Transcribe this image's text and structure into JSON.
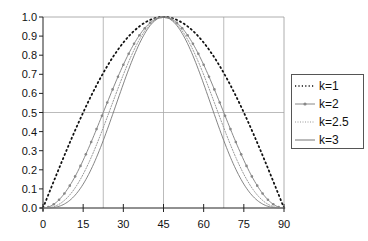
{
  "chart_data": {
    "type": "line",
    "title": "",
    "xlabel": "",
    "ylabel": "",
    "xlim": [
      0,
      90
    ],
    "ylim": [
      0,
      1.0
    ],
    "x_ticks": [
      "0",
      "15",
      "30",
      "45",
      "60",
      "75",
      "90"
    ],
    "y_ticks": [
      "0.0",
      "0.1",
      "0.2",
      "0.3",
      "0.4",
      "0.5",
      "0.6",
      "0.7",
      "0.8",
      "0.9",
      "1.0"
    ],
    "grid": {
      "vertical": [
        22.5,
        45,
        67.5
      ],
      "horizontal": [
        0.5
      ]
    },
    "legend_position": "right",
    "x": [
      0,
      7.5,
      15,
      22.5,
      30,
      37.5,
      45,
      52.5,
      60,
      67.5,
      75,
      82.5,
      90
    ],
    "series": [
      {
        "name": "k=1",
        "style": "dotted-black",
        "values": [
          0.0,
          0.259,
          0.5,
          0.707,
          0.866,
          0.966,
          1.0,
          0.966,
          0.866,
          0.707,
          0.5,
          0.259,
          0.0
        ]
      },
      {
        "name": "k=2",
        "style": "gray-with-markers",
        "values": [
          0.0,
          0.067,
          0.25,
          0.5,
          0.75,
          0.933,
          1.0,
          0.933,
          0.75,
          0.5,
          0.25,
          0.067,
          0.0
        ]
      },
      {
        "name": "k=2.5",
        "style": "dotted-gray",
        "values": [
          0.0,
          0.034,
          0.177,
          0.42,
          0.698,
          0.917,
          1.0,
          0.917,
          0.698,
          0.42,
          0.177,
          0.034,
          0.0
        ]
      },
      {
        "name": "k=3",
        "style": "thin-gray",
        "values": [
          0.0,
          0.017,
          0.125,
          0.354,
          0.65,
          0.901,
          1.0,
          0.901,
          0.65,
          0.354,
          0.125,
          0.017,
          0.0
        ]
      }
    ]
  },
  "legend": {
    "items": [
      {
        "label": "k=1"
      },
      {
        "label": "k=2"
      },
      {
        "label": "k=2.5"
      },
      {
        "label": "k=3"
      }
    ]
  }
}
